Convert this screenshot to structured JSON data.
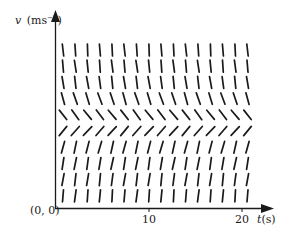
{
  "figure": {
    "type": "slope-field",
    "y_axis": {
      "label_var": "v",
      "label_unit": "(ms",
      "label_exp": "−1",
      "label_close": ")"
    },
    "x_axis": {
      "label_var": "t",
      "label_unit": "(s)",
      "ticks": [
        {
          "value": 10,
          "label": "10"
        },
        {
          "value": 20,
          "label": "20"
        }
      ]
    },
    "origin_label": "(0, 0)",
    "grid": {
      "columns": 16,
      "rows": 10,
      "row_slope_angles_deg_from_vertical": [
        -4,
        -6,
        -8,
        -18,
        -38,
        42,
        14,
        10,
        8,
        5
      ]
    },
    "colors": {
      "ink": "#1a1a1a",
      "background": "#ffffff"
    }
  },
  "chart_data": {
    "type": "slope-field",
    "title": "",
    "xlabel": "t(s)",
    "ylabel": "v (ms⁻¹)",
    "x_ticks": [
      10,
      20
    ],
    "xlim": [
      0,
      22
    ],
    "origin": "(0, 0)",
    "columns": 16,
    "rows": 10
  }
}
